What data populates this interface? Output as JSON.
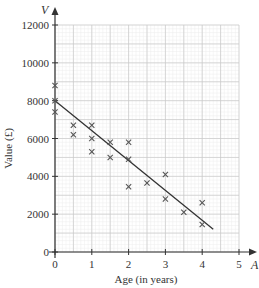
{
  "chart_data": {
    "type": "scatter",
    "title": "",
    "xlabel": "Age (in years)",
    "ylabel": "Value (£)",
    "x_axis_letter": "A",
    "y_axis_letter": "V",
    "xlim": [
      0,
      5
    ],
    "ylim": [
      0,
      12000
    ],
    "x_ticks": [
      0,
      1,
      2,
      3,
      4,
      5
    ],
    "x_tick_labels": [
      "0",
      "1",
      "2",
      "3",
      "4",
      "5"
    ],
    "y_ticks": [
      0,
      2000,
      4000,
      6000,
      8000,
      10000,
      12000
    ],
    "y_tick_labels": [
      "0",
      "2000",
      "4000",
      "6000",
      "8000",
      "10000",
      "12000"
    ],
    "grid": true,
    "marker": "x",
    "series": [
      {
        "name": "Car values",
        "points": [
          {
            "x": 0,
            "y": 8800
          },
          {
            "x": 0,
            "y": 8000
          },
          {
            "x": 0,
            "y": 7400
          },
          {
            "x": 0.5,
            "y": 6700
          },
          {
            "x": 0.5,
            "y": 6200
          },
          {
            "x": 1,
            "y": 6700
          },
          {
            "x": 1,
            "y": 6000
          },
          {
            "x": 1,
            "y": 5300
          },
          {
            "x": 1.5,
            "y": 5800
          },
          {
            "x": 1.5,
            "y": 5000
          },
          {
            "x": 2,
            "y": 5800
          },
          {
            "x": 2,
            "y": 4900
          },
          {
            "x": 2,
            "y": 3450
          },
          {
            "x": 2.5,
            "y": 3650
          },
          {
            "x": 3,
            "y": 4100
          },
          {
            "x": 3,
            "y": 2800
          },
          {
            "x": 3.5,
            "y": 2100
          },
          {
            "x": 4,
            "y": 2600
          },
          {
            "x": 4,
            "y": 1450
          }
        ]
      }
    ],
    "line_of_best_fit": {
      "x1": 0,
      "y1": 8000,
      "x2": 4.3,
      "y2": 1200
    },
    "colors": {
      "grid_major": "#c8c8c8",
      "grid_minor": "#ececec",
      "axis": "#333333",
      "marker": "#555555",
      "line": "#333333"
    }
  }
}
